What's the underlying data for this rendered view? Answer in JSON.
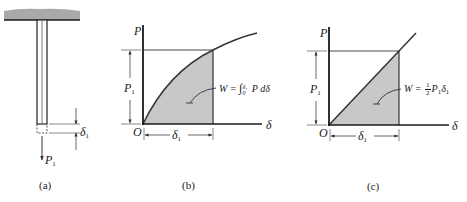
{
  "colors": {
    "stroke": "#2a2a2a",
    "fill_area": "#c8c8c8",
    "support": "#a9a9a9",
    "dim_line": "#555555"
  },
  "panel_a": {
    "caption": "(a)",
    "load_label": "P",
    "load_sub": "1",
    "elongation_label": "δ",
    "elongation_sub": "1"
  },
  "panel_b": {
    "caption": "(b)",
    "y_axis": "P",
    "x_axis": "δ",
    "origin": "O",
    "p1_label": "P",
    "p1_sub": "1",
    "d1_label": "δ",
    "d1_sub": "1",
    "formula_lhs": "W = ",
    "formula_int": "∫",
    "formula_upper": "δ₁",
    "formula_lower": "0",
    "formula_rhs": " P dδ",
    "curve_type": "nonlinear (concave)"
  },
  "panel_c": {
    "caption": "(c)",
    "y_axis": "P",
    "x_axis": "δ",
    "origin": "O",
    "p1_label": "P",
    "p1_sub": "1",
    "d1_label": "δ",
    "d1_sub": "1",
    "formula_lhs": "W = ",
    "frac_num": "1",
    "frac_den": "2",
    "formula_p": "P",
    "formula_p_sub": "1",
    "formula_d": "δ",
    "formula_d_sub": "1",
    "curve_type": "linear"
  }
}
